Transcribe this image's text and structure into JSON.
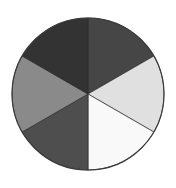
{
  "chart_data": {
    "type": "pie",
    "title": "",
    "subtitle": "",
    "xlabel": "",
    "ylabel": "",
    "legend": "none",
    "grid": false,
    "start_angle_deg": 90,
    "direction": "clockwise",
    "center": {
      "x": 88,
      "y": 94
    },
    "radius": 76,
    "background_color": "#ffffff",
    "outline_color": "#3a3a3a",
    "labels": [
      "Segment 1",
      "Segment 2",
      "Segment 3",
      "Segment 4",
      "Segment 5",
      "Segment 6"
    ],
    "values": [
      16.667,
      16.667,
      16.667,
      16.667,
      16.667,
      16.667
    ],
    "slice_angles_deg": [
      60,
      60,
      60,
      60,
      60,
      60
    ],
    "colors": [
      "#464646",
      "#e0e0e0",
      "#f9f9f9",
      "#4e4e4e",
      "#8a8a8a",
      "#333333"
    ],
    "slices": [
      {
        "name": "Segment 1",
        "position": "top-right",
        "value": 16.667,
        "angle_deg": 60,
        "color": "#464646",
        "start_deg": 90,
        "end_deg": 30
      },
      {
        "name": "Segment 2",
        "position": "right",
        "value": 16.667,
        "angle_deg": 60,
        "color": "#e0e0e0",
        "start_deg": 30,
        "end_deg": -30
      },
      {
        "name": "Segment 3",
        "position": "bottom-right",
        "value": 16.667,
        "angle_deg": 60,
        "color": "#f9f9f9",
        "start_deg": -30,
        "end_deg": -90
      },
      {
        "name": "Segment 4",
        "position": "bottom-left",
        "value": 16.667,
        "angle_deg": 60,
        "color": "#4e4e4e",
        "start_deg": -90,
        "end_deg": -150
      },
      {
        "name": "Segment 5",
        "position": "left",
        "value": 16.667,
        "angle_deg": 60,
        "color": "#8a8a8a",
        "start_deg": -150,
        "end_deg": -210
      },
      {
        "name": "Segment 6",
        "position": "top-left",
        "value": 16.667,
        "angle_deg": 60,
        "color": "#333333",
        "start_deg": -210,
        "end_deg": -270
      }
    ]
  }
}
